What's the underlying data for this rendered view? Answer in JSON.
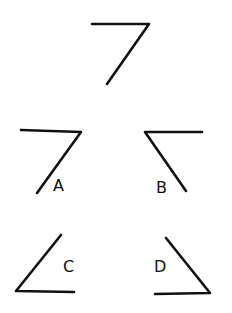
{
  "figure": {
    "stroke_color": "#111111",
    "background": "#ffffff",
    "reference": {
      "points": "92,24 149,24 107,84"
    },
    "options": [
      {
        "label": "A",
        "points": "21,130 81,132 37,193",
        "label_x": 53,
        "label_y": 191
      },
      {
        "label": "B",
        "points": "202,132 145,132 186,191",
        "label_x": 156,
        "label_y": 193
      },
      {
        "label": "C",
        "points": "61,235 16,291 74,292",
        "label_x": 63,
        "label_y": 272
      },
      {
        "label": "D",
        "points": "166,238 210,293 155,294",
        "label_x": 154,
        "label_y": 272
      }
    ]
  }
}
